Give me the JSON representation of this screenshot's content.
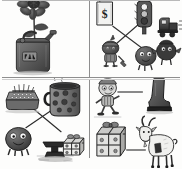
{
  "sheet": {
    "title": "Picture matching worksheet",
    "style": "grayscale pencil sketch",
    "background_color": "#fdfdfc",
    "ink_color": "#4a4a4a",
    "divider_color": "#8e8e8e",
    "layout": "2x2 grid of four illustration panels separated by ruled lines"
  },
  "panels": [
    {
      "id": "panel-top-left",
      "position": "top-left",
      "caption": "Gas can with flower",
      "items": [
        {
          "name": "gas-can",
          "label": "gas can",
          "detail": "dark metal fuel can with handle and spout, label patch on front"
        },
        {
          "name": "flower",
          "label": "flower",
          "detail": "tall dark sunflower-like bloom growing out of the can"
        }
      ],
      "connections": []
    },
    {
      "id": "panel-top-right",
      "position": "top-right",
      "caption": "Price tag, traffic light, train and creatures",
      "items": [
        {
          "name": "price-tag",
          "label": "price tag",
          "detail": "hanging rectangular tag",
          "symbol": "$"
        },
        {
          "name": "traffic-light",
          "label": "traffic light",
          "detail": "three-lamp signal head on a post"
        },
        {
          "name": "train",
          "label": "train",
          "detail": "dark steam locomotive with motion lines"
        },
        {
          "name": "knight-creature",
          "label": "knight creature",
          "detail": "small round figure in armor holding a tool"
        },
        {
          "name": "round-creature",
          "label": "round creature",
          "detail": "dark round blob character with eyes"
        },
        {
          "name": "bird-creature",
          "label": "bird creature",
          "detail": "dark rounded bird-like character"
        }
      ],
      "connections": [
        {
          "from": "price-tag",
          "to": "round-creature"
        },
        {
          "from": "traffic-light",
          "to": "knight-creature"
        }
      ]
    },
    {
      "id": "panel-bottom-left",
      "position": "bottom-left",
      "caption": "Typewriter, mug, anvil and gift box",
      "items": [
        {
          "name": "typewriter",
          "label": "typewriter",
          "detail": "boxy keyed machine seen from above"
        },
        {
          "name": "mug",
          "label": "mug",
          "detail": "polka-dot mug with rising steam"
        },
        {
          "name": "round-creature",
          "label": "round creature",
          "detail": "dark round blob character with eyes and legs"
        },
        {
          "name": "anvil",
          "label": "anvil",
          "detail": "dark anvil casting a shadow"
        },
        {
          "name": "gift-box",
          "label": "gift box",
          "detail": "wrapped present with ribbon and bow"
        }
      ],
      "connections": [
        {
          "from": "typewriter",
          "to": "anvil"
        },
        {
          "from": "mug",
          "to": "round-creature"
        }
      ]
    },
    {
      "id": "panel-bottom-right",
      "position": "bottom-right",
      "caption": "Cartoon figure, boot, gift box and goat",
      "items": [
        {
          "name": "cartoon-figure",
          "label": "cartoon figure",
          "detail": "small running character with big head"
        },
        {
          "name": "boot",
          "label": "boot",
          "detail": "dark heavy boot"
        },
        {
          "name": "gift-box",
          "label": "gift box",
          "detail": "wrapped present with ribbon and bow"
        },
        {
          "name": "goat",
          "label": "goat",
          "detail": "horned goat standing, facing left"
        }
      ],
      "connections": [
        {
          "from": "cartoon-figure",
          "to": "boot"
        },
        {
          "from": "gift-box",
          "to": "goat"
        }
      ]
    }
  ]
}
